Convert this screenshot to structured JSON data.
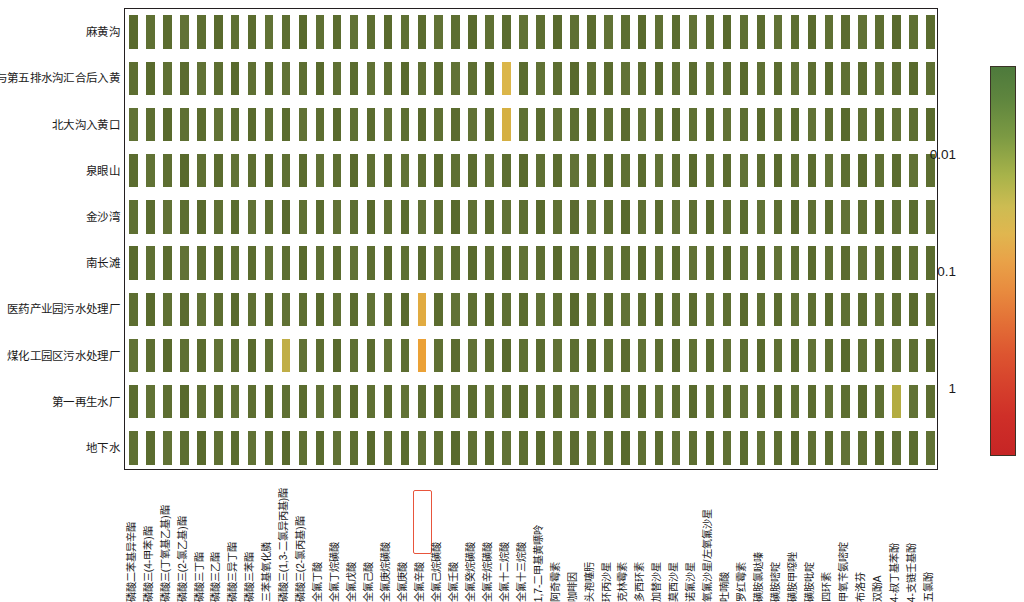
{
  "figure": {
    "type": "heatmap"
  },
  "rows": [
    "麻黄沟",
    "第三与第五排水沟汇合后入黄",
    "北大沟入黄口",
    "泉眼山",
    "金沙湾",
    "南长滩",
    "医药产业园污水处理厂",
    "煤化工园区污水处理厂",
    "第一再生水厂",
    "地下水"
  ],
  "columns": [
    "磷酸二苯基异辛酯",
    "磷酸三(4-甲苯)酯",
    "磷酸三(丁氧基乙基)酯",
    "磷酸三(2-氯乙基)酯",
    "磷酸三丁酯",
    "磷酸三乙酯",
    "磷酸三异丁酯",
    "磷酸三苯酯",
    "三苯基氧化膦",
    "磷酸三(1,3-二氯异丙基)酯",
    "磷酸三(2-氯丙基)酯",
    "全氟丁酸",
    "全氟丁烷磺酸",
    "全氟戊酸",
    "全氟己酸",
    "全氟庚烷磺酸",
    "全氟庚酸",
    "全氟辛酸",
    "全氟己烷磺酸",
    "全氟壬酸",
    "全氟癸烷磺酸",
    "全氟辛烷磺酸",
    "全氟十二烷酸",
    "全氟十三烷酸",
    "1,7-二甲基黄嘌呤",
    "阿奇霉素",
    "咖啡因",
    "头孢噻肟",
    "环丙沙星",
    "克林霉素",
    "多西环素",
    "加替沙星",
    "莫西沙星",
    "诺氟沙星",
    "氧氟沙星/左氧氟沙星",
    "吐喃酸",
    "罗红霉素",
    "磺胺氯哒嗪",
    "磺胺嘧啶",
    "磺胺甲噁唑",
    "磺胺吡啶",
    "四环素",
    "甲氧苄氨嘧啶",
    "布洛芬",
    "双酚A",
    "4-叔丁基苯酚",
    "4-支链壬基酚",
    "五氯酚"
  ],
  "highlighted_column": "全氟辛酸",
  "highlight_color": "#e8553c",
  "colorbar": {
    "ticks": [
      "0.01",
      "0.1",
      "1"
    ],
    "tick_positions": [
      0.225,
      0.525,
      0.825
    ],
    "scale": "log",
    "direction": "reversed",
    "low_color": "#4e7a3c",
    "mid_color": "#e9a248",
    "high_color": "#c62525"
  },
  "chart_data": {
    "type": "heatmap",
    "title": "",
    "xlabel": "",
    "ylabel": "",
    "colorscale": "green-yellow-orange-red (log, reversed)",
    "cbar_ticks": [
      0.01,
      0.1,
      1
    ],
    "base_cell_color": "#5d6e31",
    "anomalies": [
      {
        "row": "第三与第五排水沟汇合后入黄",
        "column": "全氟十二烷酸",
        "color": "#d9b447",
        "level": "elevated"
      },
      {
        "row": "北大沟入黄口",
        "column": "全氟十二烷酸",
        "color": "#d9b447",
        "level": "elevated"
      },
      {
        "row": "医药产业园污水处理厂",
        "column": "全氟辛酸",
        "color": "#dfa93f",
        "level": "elevated"
      },
      {
        "row": "煤化工园区污水处理厂",
        "column": "全氟辛酸",
        "color": "#efa53a",
        "level": "high"
      },
      {
        "row": "煤化工园区污水处理厂",
        "column": "磷酸三(1,3-二氯异丙基)酯",
        "color": "#c2b049",
        "level": "moderate"
      },
      {
        "row": "第一再生水厂",
        "column": "4-叔丁基苯酚",
        "color": "#b5ae44",
        "level": "moderate"
      }
    ]
  }
}
